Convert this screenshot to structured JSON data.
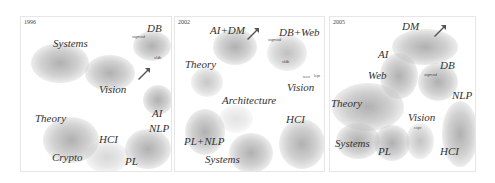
{
  "figure": {
    "panels": [
      {
        "year": "1996",
        "clusters": [
          {
            "label": "Systems"
          },
          {
            "label": "Vision"
          },
          {
            "label": "DB",
            "tiny": [
              "sigmod",
              "vldb"
            ]
          },
          {
            "label": "AI"
          },
          {
            "label": "Theory"
          },
          {
            "label": "Crypto"
          },
          {
            "label": "HCI"
          },
          {
            "label": "NLP"
          },
          {
            "label": "PL"
          }
        ],
        "arrow": "arrow-icon"
      },
      {
        "year": "2002",
        "clusters": [
          {
            "label": "AI+DM"
          },
          {
            "label": "DB+Web",
            "tiny": [
              "sigmod",
              "vldb"
            ]
          },
          {
            "label": "Theory"
          },
          {
            "label": "Vision",
            "tiny": [
              "iccv",
              "lcpr"
            ]
          },
          {
            "label": "Architecture"
          },
          {
            "label": "PL+NLP"
          },
          {
            "label": "HCI"
          },
          {
            "label": "Systems"
          }
        ],
        "arrow": "arrow-icon"
      },
      {
        "year": "2005",
        "clusters": [
          {
            "label": "DM"
          },
          {
            "label": "AI"
          },
          {
            "label": "Web"
          },
          {
            "label": "DB",
            "tiny": [
              "sigmod"
            ]
          },
          {
            "label": "Theory"
          },
          {
            "label": "NLP"
          },
          {
            "label": "Vision",
            "tiny": [
              "cvpr"
            ]
          },
          {
            "label": "Systems"
          },
          {
            "label": "PL"
          },
          {
            "label": "HCI"
          }
        ],
        "arrow": "arrow-icon"
      }
    ]
  }
}
